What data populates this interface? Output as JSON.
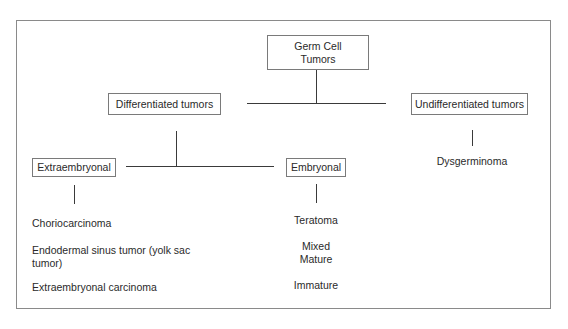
{
  "diagram": {
    "root": {
      "label": "Germ Cell\nTumors"
    },
    "level1": [
      {
        "label": "Differentiated tumors"
      },
      {
        "label": "Undifferentiated tumors"
      }
    ],
    "level2": [
      {
        "label": "Extraembryonal"
      },
      {
        "label": "Embryonal"
      }
    ],
    "leaves": {
      "extraembryonal": [
        "Choriocarcinoma",
        "Endodermal sinus tumor (yolk sac tumor)",
        "Extraembryonal carcinoma"
      ],
      "embryonal": [
        "Teratoma",
        "Mixed",
        "Mature",
        "Immature"
      ],
      "undifferentiated": [
        "Dysgerminoma"
      ]
    },
    "colors": {
      "border": "#7a7a7a",
      "line": "#3a3a3a",
      "text": "#2a2a2a",
      "background": "#ffffff"
    }
  }
}
